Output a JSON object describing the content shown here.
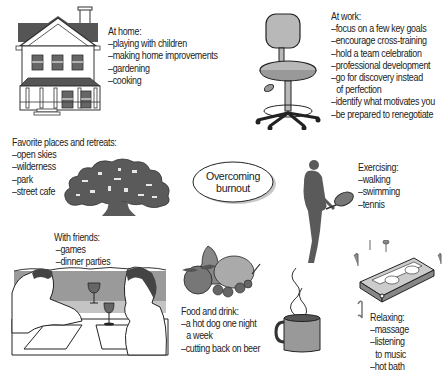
{
  "center": {
    "title_line1": "Overcoming",
    "title_line2": "burnout"
  },
  "sections": {
    "home": {
      "heading": "At home:",
      "items": [
        "–playing with children",
        "–making home improvements",
        "–gardening",
        "–cooking"
      ],
      "illustration": "house-icon"
    },
    "work": {
      "heading": "At work:",
      "items": [
        "–focus on a few key goals",
        "–encourage cross-training",
        "–hold a team celebration",
        "–professional development",
        "–go for discovery instead",
        "of perfection",
        "–identify what motivates you",
        "–be prepared to renegotiate"
      ],
      "illustration": "office-chair-icon"
    },
    "places": {
      "heading": "Favorite places and retreats:",
      "items": [
        "–open skies",
        "–wilderness",
        "–park",
        "–street cafe"
      ],
      "illustration": "tree-icon"
    },
    "exercising": {
      "heading": "Exercising:",
      "items": [
        "–walking",
        "–swimming",
        "–tennis"
      ],
      "illustration": "tennis-player-icon"
    },
    "friends": {
      "heading": "With friends:",
      "items": [
        "–games",
        "–dinner parties"
      ],
      "illustration": "dinner-couple-icon"
    },
    "food": {
      "heading": "Food and drink:",
      "items": [
        "–a hot dog one night",
        "a week",
        "–cutting back on beer"
      ],
      "illustration": "fruit-icon"
    },
    "drink": {
      "illustration": "coffee-mug-icon"
    },
    "relaxing": {
      "heading": "Relaxing:",
      "items": [
        "–massage",
        "–listening",
        "to music",
        "–hot bath"
      ],
      "illustration": "cassette-tape-icon"
    }
  },
  "colors": {
    "ink": "#222222",
    "fill_gray": "#7a7a7a",
    "dark_gray": "#555555",
    "light_gray": "#b8b8b8"
  }
}
